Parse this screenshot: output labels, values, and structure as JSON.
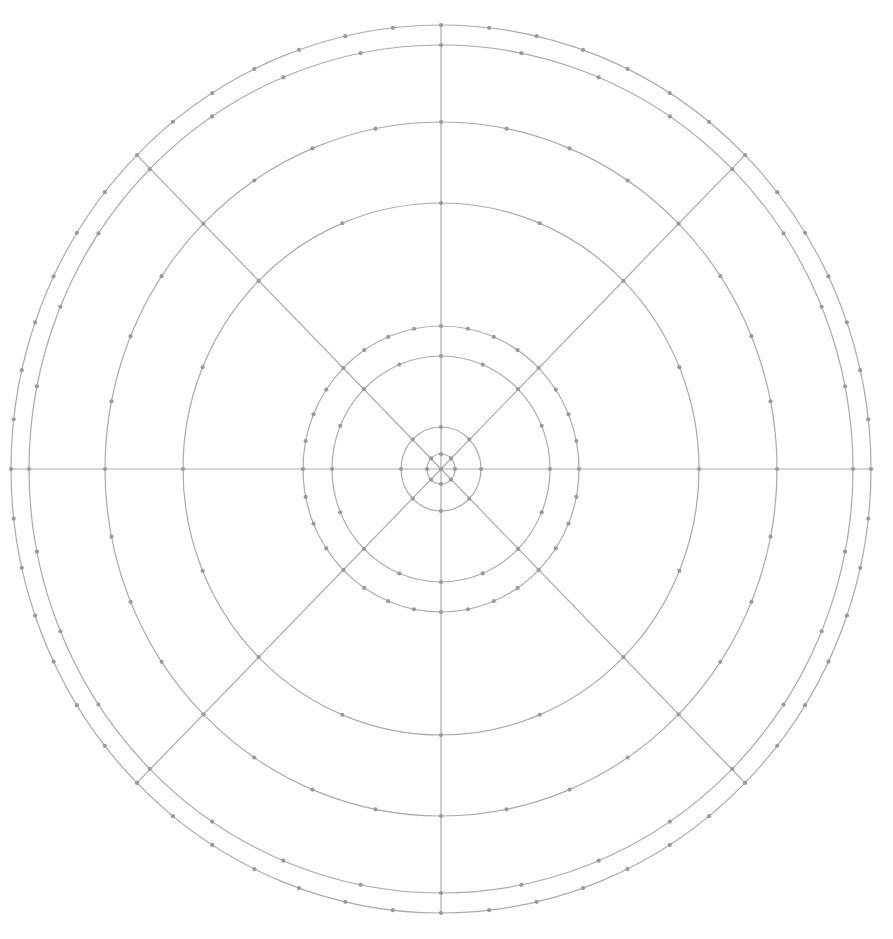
{
  "diagram": {
    "type": "polar-grid",
    "canvas": {
      "width": 893,
      "height": 939,
      "background": "#ffffff"
    },
    "center": {
      "x": 441,
      "y": 469
    },
    "colors": {
      "line": "#ababab",
      "dot": "#9a9a9a"
    },
    "line_width": 1.2,
    "dot_radius": 2.1,
    "radial_lines": {
      "count": 8,
      "angle_step_deg": 45,
      "extends_to_ring": 7
    },
    "rings": [
      {
        "id": "ring-1",
        "rx": 14,
        "ry": 15,
        "dot_step_deg": 45
      },
      {
        "id": "ring-2",
        "rx": 40,
        "ry": 42,
        "dot_step_deg": 45
      },
      {
        "id": "ring-3",
        "rx": 109,
        "ry": 113,
        "dot_step_deg": 22.5
      },
      {
        "id": "ring-4",
        "rx": 138,
        "ry": 143,
        "dot_step_deg": 11.25
      },
      {
        "id": "ring-5",
        "rx": 258,
        "ry": 266,
        "dot_step_deg": 22.5
      },
      {
        "id": "ring-6",
        "rx": 336,
        "ry": 347,
        "dot_step_deg": 11.25
      },
      {
        "id": "ring-7",
        "rx": 412,
        "ry": 424,
        "dot_step_deg": 11.25
      },
      {
        "id": "ring-8",
        "rx": 430,
        "ry": 444,
        "dot_step_deg": 6.428571
      }
    ]
  }
}
